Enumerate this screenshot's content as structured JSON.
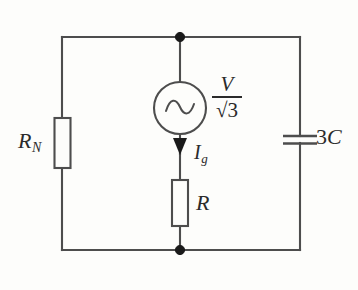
{
  "figure": {
    "background_color": "#fdfdfb",
    "line_color": "#4d4d4d",
    "node_color": "#1a1a1a"
  },
  "labels": {
    "left_resistor": {
      "symbol": "R",
      "subscript": "N"
    },
    "series_resistor": {
      "symbol": "R"
    },
    "current": {
      "symbol": "I",
      "subscript": "g"
    },
    "capacitor": {
      "coefficient": "3",
      "symbol": "C"
    },
    "source": {
      "numerator": "V",
      "denominator": "√3"
    }
  },
  "components": [
    {
      "name": "resistor-rn",
      "type": "resistor",
      "branch": "left",
      "label": "R_N"
    },
    {
      "name": "ac-source",
      "type": "ac-voltage-source",
      "branch": "middle",
      "label": "V/√3"
    },
    {
      "name": "current-arrow",
      "type": "current-arrow",
      "branch": "middle",
      "direction": "down",
      "label": "I_g"
    },
    {
      "name": "resistor-r",
      "type": "resistor",
      "branch": "middle",
      "label": "R"
    },
    {
      "name": "capacitor-3c",
      "type": "capacitor",
      "branch": "right",
      "label": "3C"
    }
  ],
  "nodes": [
    {
      "name": "top-node",
      "x": 180,
      "y": 37
    },
    {
      "name": "bottom-node",
      "x": 180,
      "y": 250
    }
  ]
}
